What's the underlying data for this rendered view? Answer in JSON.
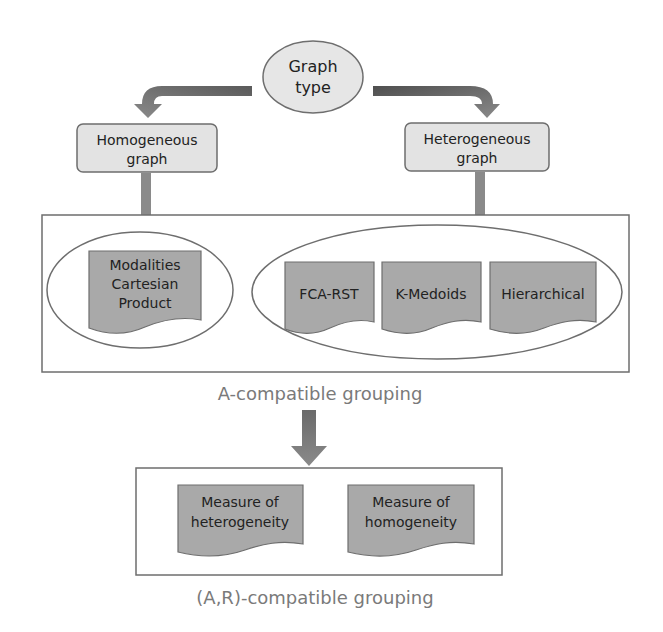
{
  "diagram": {
    "root": {
      "lines": [
        "Graph",
        "type"
      ]
    },
    "branches": {
      "homogeneous": {
        "lines": [
          "Homogeneous",
          "graph"
        ]
      },
      "heterogeneous": {
        "lines": [
          "Heterogeneous",
          "graph"
        ]
      }
    },
    "a_compatible": {
      "caption": "A-compatible grouping",
      "homogeneous_methods": [
        {
          "lines": [
            "Modalities",
            "Cartesian",
            "Product"
          ]
        }
      ],
      "heterogeneous_methods": [
        {
          "lines": [
            "FCA-RST"
          ]
        },
        {
          "lines": [
            "K-Medoids"
          ]
        },
        {
          "lines": [
            "Hierarchical"
          ]
        }
      ]
    },
    "ar_compatible": {
      "caption": "(A,R)-compatible grouping",
      "measures": [
        {
          "lines": [
            "Measure of",
            "heterogeneity"
          ]
        },
        {
          "lines": [
            "Measure of",
            "homogeneity"
          ]
        }
      ]
    }
  },
  "colors": {
    "ellipse_fill": "#e6e6e6",
    "box_fill": "#e3e3e3",
    "document_fill": "#a9a9a9",
    "arrow_dark": "#5a5a5a",
    "arrow_light": "#8a8a8a",
    "outline": "#6e6e6e",
    "caption": "#7a7a7a"
  }
}
